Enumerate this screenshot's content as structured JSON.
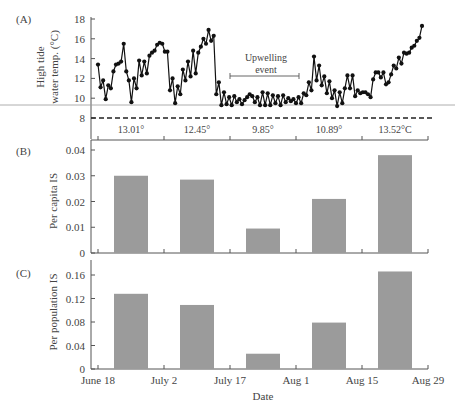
{
  "chart_data": [
    {
      "panel": "(A)",
      "type": "line",
      "ylabel_line1": "High tide",
      "ylabel_line2": "water temp. (°C)",
      "yticks": [
        "8",
        "10",
        "12",
        "14",
        "16",
        "18"
      ],
      "ylim": [
        8,
        18
      ],
      "reference_line": {
        "value": 8,
        "style": "dashed"
      },
      "annotation": {
        "line1": "Upwelling",
        "line2": "event"
      },
      "period_means": [
        "13.01°",
        "12.45°",
        "9.85°",
        "10.89°",
        "13.52°C"
      ],
      "series": [
        {
          "name": "High tide water temp.",
          "values": [
            13.4,
            11.1,
            11.8,
            9.9,
            11.3,
            11.0,
            12.7,
            13.4,
            13.5,
            13.7,
            15.5,
            12.7,
            11.8,
            9.6,
            12.0,
            11.0,
            13.8,
            12.3,
            13.7,
            12.5,
            14.3,
            14.6,
            14.8,
            15.4,
            15.6,
            15.5,
            14.7,
            14.7,
            10.8,
            12.0,
            9.5,
            11.2,
            10.4,
            12.9,
            11.8,
            13.7,
            12.2,
            14.8,
            12.5,
            14.6,
            15.2,
            16.0,
            15.5,
            16.9,
            15.8,
            16.3,
            10.4,
            11.6,
            9.3,
            10.6,
            9.4,
            10.1,
            9.3,
            10.2,
            9.6,
            9.9,
            9.4,
            9.8,
            10.1,
            10.4,
            10.2,
            9.6,
            10.1,
            9.3,
            10.6,
            9.3,
            10.5,
            9.3,
            10.3,
            9.5,
            10.2,
            9.3,
            10.3,
            9.6,
            10.0,
            9.7,
            9.9,
            9.5,
            10.1,
            9.5,
            10.5,
            10.3,
            11.6,
            10.8,
            14.2,
            11.8,
            13.3,
            11.3,
            12.2,
            10.5,
            11.7,
            10.0,
            10.8,
            9.2,
            10.6,
            9.5,
            11.0,
            12.3,
            11.0,
            12.3,
            10.2,
            10.8,
            10.5,
            10.6,
            10.6,
            10.4,
            10.1,
            11.9,
            12.6,
            12.6,
            12.1,
            12.6,
            11.4,
            11.6,
            12.4,
            13.3,
            13.0,
            14.1,
            13.5,
            14.6,
            14.5,
            14.6,
            15.1,
            15.3,
            15.8,
            16.1,
            17.3
          ]
        }
      ]
    },
    {
      "panel": "(B)",
      "type": "bar",
      "ylabel": "Per capita IS",
      "yticks": [
        "0",
        "0.01",
        "0.02",
        "0.03",
        "0.04"
      ],
      "ylim": [
        0,
        0.045
      ],
      "categories": [
        "June 18–July 2",
        "July 2–July 17",
        "July 17–Aug 1",
        "Aug 1–Aug 15",
        "Aug 15–Aug 29"
      ],
      "values": [
        0.03,
        0.0285,
        0.0095,
        0.021,
        0.038
      ]
    },
    {
      "panel": "(C)",
      "type": "bar",
      "ylabel": "Per population IS",
      "xlabel": "Date",
      "yticks": [
        "0",
        "0.04",
        "0.08",
        "0.12",
        "0.16"
      ],
      "ylim": [
        0,
        0.17
      ],
      "xticks": [
        "June 18",
        "July 2",
        "July 17",
        "Aug 1",
        "Aug 15",
        "Aug 29"
      ],
      "categories": [
        "June 18–July 2",
        "July 2–July 17",
        "July 17–Aug 1",
        "Aug 1–Aug 15",
        "Aug 15–Aug 29"
      ],
      "values": [
        0.128,
        0.109,
        0.026,
        0.079,
        0.166
      ]
    }
  ],
  "colors": {
    "bar": "#9b9b9b",
    "line": "#111111",
    "axis": "#555555",
    "text": "#444444"
  }
}
